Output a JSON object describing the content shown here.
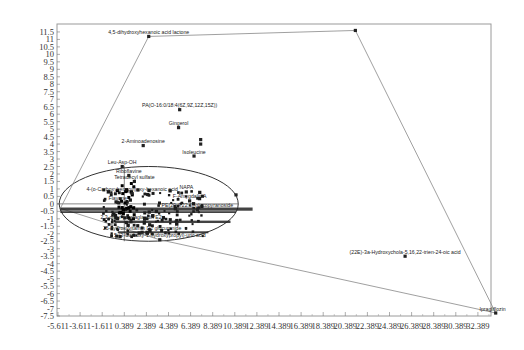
{
  "chart_data": {
    "type": "scatter",
    "title": "",
    "xlabel": "",
    "ylabel": "",
    "xlim": [
      -5.611,
      34.0
    ],
    "ylim": [
      -7.5,
      11.8
    ],
    "grid": false,
    "legend": null,
    "x_ticks": [
      "-5.611",
      "-3.611",
      "-1.611",
      "0.389",
      "2.389",
      "4.389",
      "6.389",
      "8.389",
      "10.389",
      "12.389",
      "14.389",
      "16.389",
      "18.389",
      "20.389",
      "22.389",
      "24.389",
      "26.389",
      "28.389",
      "30.389",
      "32.389"
    ],
    "y_ticks": [
      "11.5",
      "11",
      "10.5",
      "10",
      "9.5",
      "9",
      "8.5",
      "8",
      "7.5",
      "7",
      "6.5",
      "6",
      "5.5",
      "5",
      "4.5",
      "4",
      "3.5",
      "3",
      "2.5",
      "2",
      "1.5",
      "1",
      "0.5",
      "0",
      "-0.5",
      "-1",
      "-1.5",
      "-2",
      "-2.5",
      "-3",
      "-3.5",
      "-4",
      "-4.5",
      "-5",
      "-5.5",
      "-6",
      "-6.5",
      "-7",
      "-7.5"
    ],
    "labeled_points": [
      {
        "label": "4,5-dihydroxyhexanoic acid lactone",
        "x": 2.6,
        "y": 11.2
      },
      {
        "label": "PA(O-16:0/18:4(6Z,9Z,12Z,15Z))",
        "x": 5.4,
        "y": 6.3
      },
      {
        "label": "Gingerol",
        "x": 5.3,
        "y": 5.1
      },
      {
        "label": "2-Aminoadenosine",
        "x": 2.1,
        "y": 3.9
      },
      {
        "label": "Isoleucine",
        "x": 6.7,
        "y": 3.2
      },
      {
        "label": "Leu-Asp-OH",
        "x": 0.2,
        "y": 2.5
      },
      {
        "label": "Riboflavine",
        "x": 0.8,
        "y": 1.9
      },
      {
        "label": "Tetradecyl sulfate",
        "x": 1.3,
        "y": 1.5
      },
      {
        "label": "4-(o-Carboxybenzoyl)oxy-hexanoic acid",
        "x": 1.1,
        "y": 0.7
      },
      {
        "label": "NAPA",
        "x": 6.0,
        "y": 0.8
      },
      {
        "label": "F-Amygdalin A",
        "x": 6.3,
        "y": 0.2
      },
      {
        "label": "Flavone",
        "x": -0.2,
        "y": 0.1
      },
      {
        "label": "PE(20:4/22:6)-glucopyranoside",
        "x": 7.0,
        "y": -0.4
      },
      {
        "label": "2,3-dinor-prostaglandin E2",
        "x": 1.0,
        "y": -1.2
      },
      {
        "label": "25-hydroxyvitamin D2 glucuronide",
        "x": 2.0,
        "y": -1.9
      },
      {
        "label": "5-(3-Carboxy-1-hydroxypropyl)-uric acid",
        "x": 3.6,
        "y": -2.4
      },
      {
        "label": "(22E)-3a-Hydroxychola-5,16,22-trien-24-oic acid",
        "x": 25.8,
        "y": -3.5
      },
      {
        "label": "Ipragliflozin",
        "x": 34.0,
        "y": -7.3
      }
    ],
    "unlabeled_points": [
      {
        "x": 21.3,
        "y": 11.6
      },
      {
        "x": 7.3,
        "y": 4.3
      },
      {
        "x": 7.3,
        "y": 4.0
      },
      {
        "x": 10.5,
        "y": 0.6
      }
    ],
    "overlays": {
      "confidence_ellipse": {
        "cx": 2.6,
        "cy": 0.0,
        "rx": 8.1,
        "ry": 2.5
      },
      "convex_hull": [
        [
          2.6,
          11.2
        ],
        [
          21.3,
          11.6
        ],
        [
          34.0,
          -7.3
        ],
        [
          3.6,
          -2.4
        ],
        [
          -5.4,
          -0.3
        ]
      ],
      "reference_lines": {
        "x0": 0.389,
        "y0": 0.0
      }
    },
    "dense_region_labels": "Many overlapping labels around y≈-0.3 to -2.5 (illegible, stacked)"
  }
}
